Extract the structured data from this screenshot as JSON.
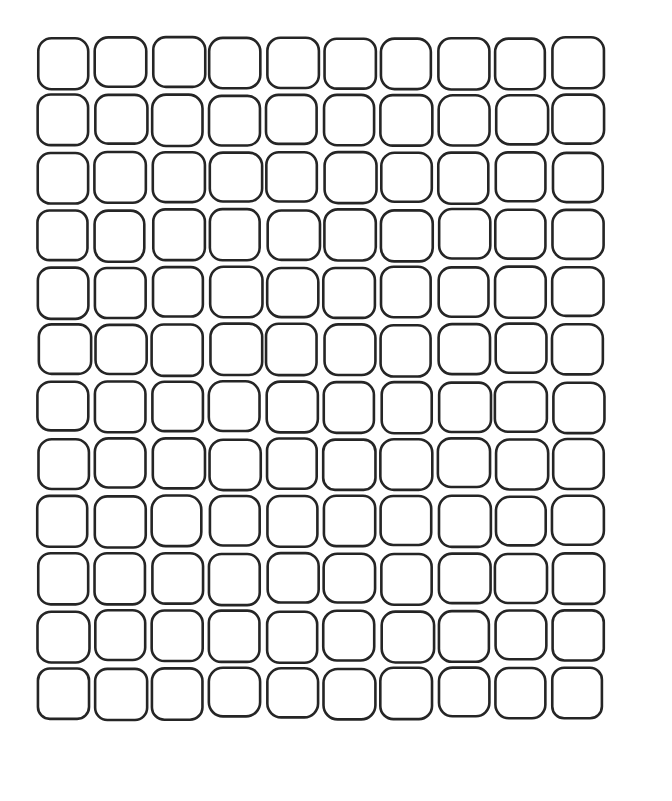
{
  "document": {
    "kind": "blank-grid-worksheet",
    "title": "Blank Rounded Square Grid",
    "description": "A printed worksheet sheet containing an empty grid of hand-drawn rounded squares. All cells are blank.",
    "background_color": "#ffffff",
    "page": {
      "width": 672,
      "height": 801
    }
  },
  "grid": {
    "rows": 12,
    "columns": 10,
    "total_cells": 120,
    "origin_x": 38,
    "origin_y": 38,
    "cell_width": 51,
    "cell_height": 50,
    "column_pitch": 57.2,
    "row_pitch": 57.3,
    "corner_radius": 13,
    "stroke_color": "#252525",
    "stroke_width": 2.6,
    "fill_color": "#ffffff",
    "cell_label": "",
    "cell_state": "empty",
    "row_labels": [
      "1",
      "2",
      "3",
      "4",
      "5",
      "6",
      "7",
      "8",
      "9",
      "10",
      "11",
      "12"
    ],
    "column_labels": [
      "1",
      "2",
      "3",
      "4",
      "5",
      "6",
      "7",
      "8",
      "9",
      "10"
    ]
  },
  "margins": {
    "left": 38,
    "top": 38,
    "right": 34,
    "bottom": 46
  }
}
